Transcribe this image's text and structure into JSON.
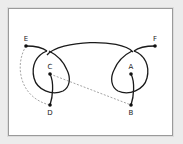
{
  "diagram": {
    "type": "knot-diagram",
    "colors": {
      "background": "#ececec",
      "panel": "#ffffff",
      "border": "#9a9a9a",
      "solid_stroke": "#1a1a1a",
      "dashed_stroke": "#9a9a9a",
      "node": "#111111"
    },
    "nodes": [
      {
        "id": "A",
        "label": "A",
        "x": 131,
        "y": 74
      },
      {
        "id": "B",
        "label": "B",
        "x": 131,
        "y": 105
      },
      {
        "id": "C",
        "label": "C",
        "x": 50,
        "y": 74
      },
      {
        "id": "D",
        "label": "D",
        "x": 50,
        "y": 105
      },
      {
        "id": "E",
        "label": "E",
        "x": 26,
        "y": 46
      },
      {
        "id": "F",
        "label": "F",
        "x": 155,
        "y": 46
      }
    ],
    "edges": [
      {
        "from": "E",
        "to": "F",
        "style": "solid",
        "shape": "arc-with-loops"
      },
      {
        "from": "C",
        "to": "D",
        "style": "solid",
        "shape": "curve"
      },
      {
        "from": "A",
        "to": "B",
        "style": "solid",
        "shape": "curve"
      },
      {
        "from": "C",
        "to": "B",
        "style": "dashed",
        "shape": "straight"
      },
      {
        "from": "E",
        "to": "D",
        "style": "dashed",
        "shape": "curve"
      }
    ]
  }
}
